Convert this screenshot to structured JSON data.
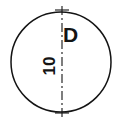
{
  "drawing": {
    "type": "engineering-drawing",
    "title": "Hole detail with diameter and depth callout",
    "background_color": "#ffffff",
    "line_color": "#141414",
    "canvas": {
      "width": 120,
      "height": 124
    },
    "circle": {
      "name": "hole-outline",
      "center_x": 61,
      "center_y": 62,
      "radius": 50,
      "stroke_width": 1.5,
      "fill": "none"
    },
    "centerline": {
      "name": "vertical-centerline",
      "x": 62,
      "y_start": 6,
      "y_end": 118,
      "stroke_width": 1.1,
      "dash_pattern": "9 3 2 3",
      "cross_mark_top_y": 10,
      "cross_mark_bottom_y": 113,
      "cross_mark_half_width": 7
    },
    "labels": {
      "diameter": {
        "text": "D",
        "orientation": "horizontal",
        "rotation_deg": 0
      },
      "depth": {
        "text": "10",
        "orientation": "vertical",
        "rotation_deg": -90
      }
    }
  }
}
